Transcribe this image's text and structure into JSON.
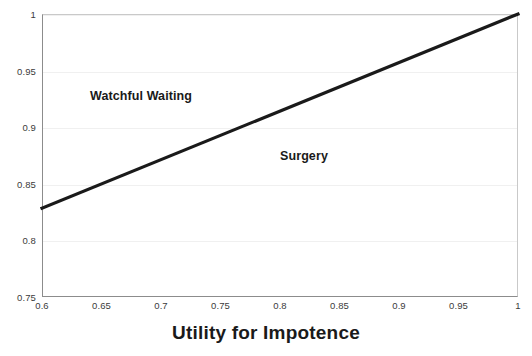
{
  "chart_data": {
    "type": "line",
    "title": "",
    "xlabel": "Utility for Impotence",
    "ylabel": "",
    "xlim": [
      0.6,
      1.0
    ],
    "ylim": [
      0.75,
      1.0
    ],
    "grid": true,
    "legend": "none",
    "x_ticks": [
      "0.6",
      "0.65",
      "0.7",
      "0.75",
      "0.8",
      "0.85",
      "0.9",
      "0.95",
      "1"
    ],
    "x_tick_values": [
      0.6,
      0.65,
      0.7,
      0.75,
      0.8,
      0.85,
      0.9,
      0.95,
      1.0
    ],
    "y_ticks": [
      "0.75",
      "0.8",
      "0.85",
      "0.9",
      "0.95",
      "1"
    ],
    "y_tick_values": [
      0.75,
      0.8,
      0.85,
      0.9,
      0.95,
      1.0
    ],
    "series": [
      {
        "name": "threshold-line",
        "color": "#1a1a1a",
        "linewidth": 3,
        "x": [
          0.6,
          1.0
        ],
        "values": [
          0.8285,
          1.0
        ]
      }
    ],
    "annotations": [
      {
        "text": "Watchful Waiting",
        "x": 0.64,
        "y": 0.935,
        "region": "above-line"
      },
      {
        "text": "Surgery",
        "x": 0.8,
        "y": 0.882,
        "region": "below-line"
      }
    ]
  },
  "axes": {
    "x_title": "Utility for Impotence"
  },
  "colors": {
    "line": "#1a1a1a",
    "grid": "#f0f0f0",
    "axis": "#8c8c8c",
    "text": "#231f20",
    "background": "#ffffff"
  }
}
